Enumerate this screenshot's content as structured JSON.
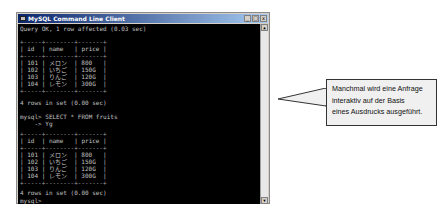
{
  "window": {
    "title": "MySQL Command Line Client",
    "buttons": {
      "minimize": "_",
      "maximize": "□",
      "close": "x"
    }
  },
  "console": {
    "lines_top": [
      "Query OK, 1 row affected (0.03 sec)"
    ],
    "table1": {
      "separator": "+-----+--------+-------+",
      "header": "| id  | name   | price |",
      "rows": [
        "| 101 | メロン  | 800   |",
        "| 102 | いちご  | 150G  |",
        "| 103 | りんご  | 120G  |",
        "| 104 | レモン  | 300G  |"
      ]
    },
    "result1": "4 rows in set (0.00 sec)",
    "query_line1": "mysql> SELECT * FROM fruits",
    "query_line2": "    -> Yg",
    "table2": {
      "separator": "+-----+--------+-------+",
      "header": "| id  | name   | price |",
      "rows": [
        "| 101 | メロン  | 800   |",
        "| 102 | いちご  | 150G  |",
        "| 103 | りんご  | 120G  |",
        "| 104 | レモン  | 300G  |"
      ]
    },
    "result2": "4 rows in set (0.00 sec)",
    "prompt": "mysql> _"
  },
  "callout": {
    "line1": "Manchmal wird eine Anfrage",
    "line2": "interaktiv auf der Basis",
    "line3": "eines Ausdrucks ausgeführt."
  }
}
